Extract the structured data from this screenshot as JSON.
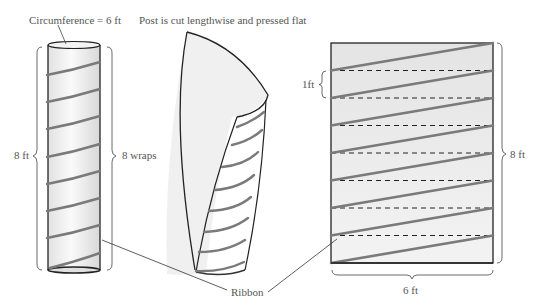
{
  "labels": {
    "circumference": "Circumference = 6 ft",
    "caption": "Post is cut lengthwise and pressed flat",
    "height_left": "8 ft",
    "wraps": "8 wraps",
    "one_ft": "1ft",
    "height_right": "8 ft",
    "width_bottom": "6 ft",
    "ribbon": "Ribbon"
  },
  "figure": {
    "post_height_ft": 8,
    "circumference_ft": 6,
    "wraps": 8,
    "wrap_spacing_ft": 1
  },
  "colors": {
    "ribbon": "#7a7a7a",
    "outline": "#222222",
    "fill": "#ececec",
    "text": "#555555"
  }
}
